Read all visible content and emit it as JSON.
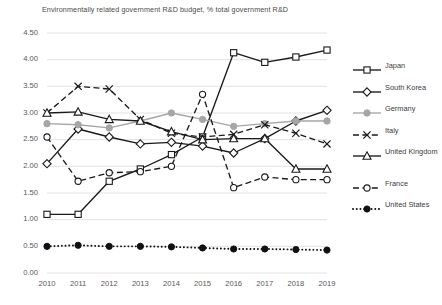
{
  "chart_data": {
    "type": "line",
    "title": "Environmentally related government R&D budget, % total government R&D",
    "xlabel": "",
    "ylabel": "",
    "categories": [
      "2010",
      "2011",
      "2012",
      "2013",
      "2014",
      "2015",
      "2016",
      "2017",
      "2018",
      "2019"
    ],
    "x": [
      2010,
      2011,
      2012,
      2013,
      2014,
      2015,
      2016,
      2017,
      2018,
      2019
    ],
    "ylim": [
      0.0,
      4.5
    ],
    "ytick_step": 0.5,
    "ytick_labels": [
      "0.00",
      "0.50",
      "1.00",
      "1.50",
      "2.00",
      "2.50",
      "3.00",
      "3.50",
      "4.00",
      "4.50"
    ],
    "grid": true,
    "legend_position": "right",
    "series": [
      {
        "name": "Japan",
        "marker": "square-open",
        "line": "solid",
        "color": "#1a1a1a",
        "values": [
          1.1,
          1.1,
          1.72,
          1.95,
          2.22,
          2.55,
          4.13,
          3.95,
          4.05,
          4.18
        ]
      },
      {
        "name": "South Korea",
        "marker": "diamond-open",
        "line": "solid",
        "color": "#1a1a1a",
        "values": [
          2.05,
          2.7,
          2.55,
          2.42,
          2.45,
          2.38,
          2.25,
          2.52,
          2.85,
          3.05
        ]
      },
      {
        "name": "Germany",
        "marker": "circle-filled",
        "line": "solid",
        "color": "#a6a6a6",
        "values": [
          2.8,
          2.78,
          2.72,
          2.85,
          3.0,
          2.88,
          2.75,
          2.8,
          2.85,
          2.85
        ]
      },
      {
        "name": "Italy",
        "marker": "x-cross",
        "line": "dashed",
        "color": "#1a1a1a",
        "values": [
          3.0,
          3.5,
          3.45,
          2.88,
          2.62,
          2.55,
          2.6,
          2.78,
          2.62,
          2.42
        ]
      },
      {
        "name": "United Kingdom",
        "marker": "triangle-open",
        "line": "solid",
        "color": "#1a1a1a",
        "values": [
          3.0,
          3.02,
          2.88,
          2.85,
          2.65,
          2.5,
          2.52,
          2.52,
          1.95,
          1.95
        ]
      },
      {
        "name": "France",
        "marker": "circle-open",
        "line": "dashed",
        "color": "#1a1a1a",
        "values": [
          2.55,
          1.72,
          1.88,
          1.9,
          2.0,
          3.35,
          1.6,
          1.8,
          1.75,
          1.75
        ]
      },
      {
        "name": "United States",
        "marker": "circle-solid-small",
        "line": "dotted",
        "color": "#111111",
        "values": [
          0.5,
          0.52,
          0.5,
          0.5,
          0.49,
          0.47,
          0.45,
          0.45,
          0.44,
          0.43
        ]
      }
    ]
  },
  "legend": {
    "items": [
      {
        "label": "Japan"
      },
      {
        "label": "South Korea"
      },
      {
        "label": "Germany"
      },
      {
        "label": "Italy"
      },
      {
        "label": "United Kingdom"
      },
      {
        "label": "France"
      },
      {
        "label": "United States"
      }
    ]
  }
}
